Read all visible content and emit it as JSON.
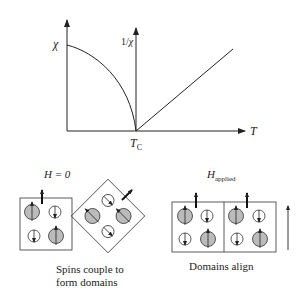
{
  "graph": {
    "y_label_left": "χ",
    "y_label_right_prefix": "1/",
    "y_label_right_symbol": "χ",
    "x_label": "T",
    "critical_label": "T",
    "critical_subscript": "C",
    "curves": [
      {
        "name": "susceptibility",
        "description": "χ decreases from a maximum at T=0 and falls to zero at T_C"
      },
      {
        "name": "inverse-susceptibility",
        "description": "1/χ increases linearly above T_C"
      }
    ]
  },
  "left_panel": {
    "field_label": "H = 0",
    "caption_line1": "Spins couple to",
    "caption_line2": "form domains"
  },
  "right_panel": {
    "field_label": "H",
    "field_subscript": "applied",
    "caption": "Domains align"
  }
}
